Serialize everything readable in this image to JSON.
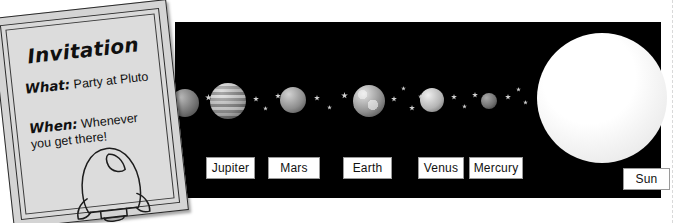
{
  "page": {
    "background_color": "#ffffff",
    "cut_off_header_text": "",
    "margin_guide": "dashed-right-margin"
  },
  "invitation_card": {
    "title": "Invitation",
    "rows": [
      {
        "label": "What:",
        "value": "Party at Pluto"
      },
      {
        "label": "When:",
        "value": "Whenever you get there!"
      }
    ],
    "illustration": "rocket-outline-drawing",
    "paper_color": "#dcdcdc",
    "border_color": "#2b2b2b",
    "rotation_degrees": -6.2
  },
  "solar_system_panel": {
    "background_color": "#000000",
    "star_color": "#cfcfcf",
    "label_text_color": "#111111",
    "label_background_color": "#ffffff",
    "sun": {
      "name": "Sun",
      "label": "Sun",
      "color": "#f3f3f3",
      "cx": 427,
      "cy": 76,
      "r": 65
    },
    "rocket": {
      "name": "rocket-ship",
      "direction": "flying-left-toward-pluto",
      "body_color": "#8e8e8e",
      "flame_color": "#9b9b9b"
    },
    "planets": [
      {
        "name": "Saturn",
        "label": "",
        "cx": 10,
        "cy": 81,
        "r": 14,
        "label_x": 6,
        "label_w": 46,
        "label_visible": false
      },
      {
        "name": "Jupiter",
        "label": "Jupiter",
        "cx": 53,
        "cy": 79,
        "r": 18,
        "label_x": 31,
        "label_w": 47,
        "label_visible": true
      },
      {
        "name": "Mars",
        "label": "Mars",
        "cx": 118,
        "cy": 78,
        "r": 13,
        "label_x": 93,
        "label_w": 50,
        "label_visible": true
      },
      {
        "name": "Earth",
        "label": "Earth",
        "cx": 194,
        "cy": 79,
        "r": 16,
        "label_x": 168,
        "label_w": 47,
        "label_visible": true
      },
      {
        "name": "Venus",
        "label": "Venus",
        "cx": 257,
        "cy": 78,
        "r": 12,
        "label_x": 243,
        "label_w": 44,
        "label_visible": true
      },
      {
        "name": "Mercury",
        "label": "Mercury",
        "cx": 314,
        "cy": 79,
        "r": 8,
        "label_x": 294,
        "label_w": 52,
        "label_visible": true
      }
    ],
    "stars": [
      {
        "x": 30,
        "y": 72,
        "s": 7
      },
      {
        "x": 13,
        "y": 82,
        "s": 5
      },
      {
        "x": 78,
        "y": 74,
        "s": 6
      },
      {
        "x": 88,
        "y": 84,
        "s": 5
      },
      {
        "x": 100,
        "y": 71,
        "s": 6
      },
      {
        "x": 139,
        "y": 73,
        "s": 6
      },
      {
        "x": 152,
        "y": 83,
        "s": 5
      },
      {
        "x": 166,
        "y": 70,
        "s": 7
      },
      {
        "x": 178,
        "y": 82,
        "s": 5
      },
      {
        "x": 216,
        "y": 74,
        "s": 6
      },
      {
        "x": 226,
        "y": 64,
        "s": 5
      },
      {
        "x": 234,
        "y": 83,
        "s": 6
      },
      {
        "x": 243,
        "y": 72,
        "s": 5
      },
      {
        "x": 276,
        "y": 72,
        "s": 6
      },
      {
        "x": 287,
        "y": 82,
        "s": 5
      },
      {
        "x": 297,
        "y": 70,
        "s": 6
      },
      {
        "x": 330,
        "y": 72,
        "s": 6
      },
      {
        "x": 341,
        "y": 65,
        "s": 5
      },
      {
        "x": 348,
        "y": 78,
        "s": 5
      }
    ],
    "label_row_y": 135
  }
}
